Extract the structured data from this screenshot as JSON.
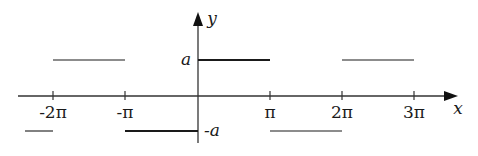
{
  "diagram": {
    "title": "",
    "type": "square wave (piecewise constant function)",
    "axes": {
      "x_label": "x",
      "y_label": "y",
      "x_ticks": [
        {
          "value": -2,
          "label": "-2π",
          "px": 53
        },
        {
          "value": -1,
          "label": "-π",
          "px": 125
        },
        {
          "value": 1,
          "label": "π",
          "px": 270
        },
        {
          "value": 2,
          "label": "2π",
          "px": 342
        },
        {
          "value": 3,
          "label": "3π",
          "px": 414
        }
      ],
      "y_levels": [
        {
          "label": "a",
          "value": 1
        },
        {
          "label": "-a",
          "value": -1
        }
      ]
    },
    "segments": [
      {
        "from": "-2.5π",
        "to": "-2π",
        "level": "-a"
      },
      {
        "from": "-2π",
        "to": "-π",
        "level": "a"
      },
      {
        "from": "-π",
        "to": "0",
        "level": "-a"
      },
      {
        "from": "0",
        "to": "π",
        "level": "a"
      },
      {
        "from": "π",
        "to": "2π",
        "level": "-a"
      },
      {
        "from": "2π",
        "to": "3π",
        "level": "a"
      }
    ],
    "colors": {
      "line": "#1a1a1a",
      "axis": "#333333",
      "background": "#ffffff"
    }
  }
}
